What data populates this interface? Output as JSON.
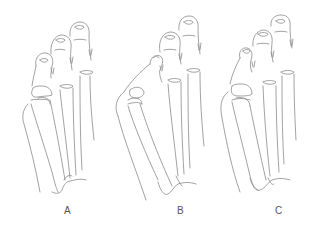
{
  "figure": {
    "panels": [
      {
        "label": "A",
        "description": "foot skeleton, mild hallux valgus"
      },
      {
        "label": "B",
        "description": "foot skeleton, pronounced bunion"
      },
      {
        "label": "C",
        "description": "foot skeleton, moderate bunion"
      }
    ],
    "stroke_color": "#8a8a8a",
    "background": "#ffffff"
  }
}
